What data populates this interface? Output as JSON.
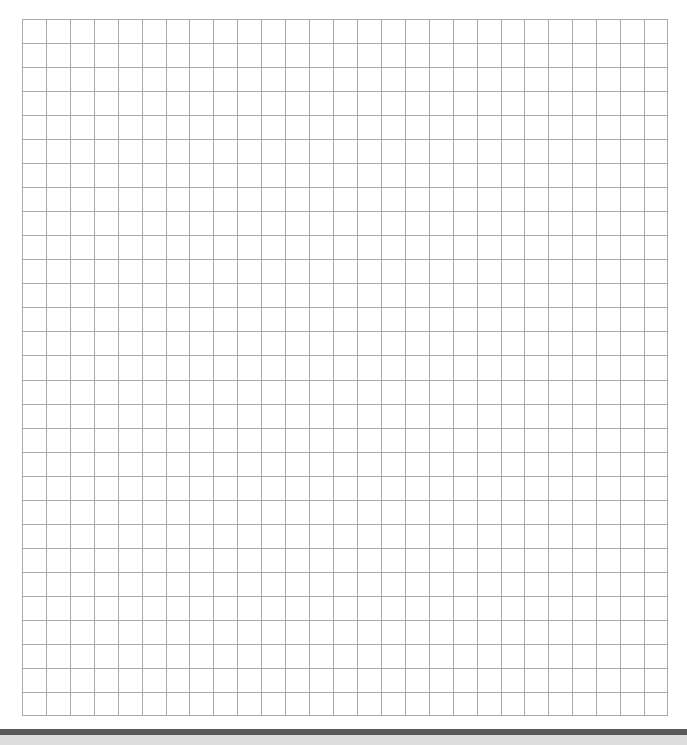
{
  "page": {
    "type": "graph-paper-scan",
    "background_color": "#ffffff"
  },
  "grid": {
    "columns": 27,
    "rows": 29,
    "left": 22,
    "top": 19,
    "width": 646,
    "height": 697,
    "line_color": "#a9a9a9"
  },
  "footer": {
    "dark_bar_color": "#5a5a5a",
    "light_band_color": "#dcdcdc"
  }
}
